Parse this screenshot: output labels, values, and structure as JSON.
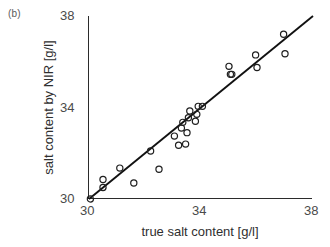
{
  "panel": {
    "label": "(b)"
  },
  "chart_data": {
    "type": "scatter",
    "title": "",
    "subtitle": "",
    "xlabel": "true salt content [g/l]",
    "ylabel": "salt content by NIR [g/l]",
    "xlim": [
      30,
      38
    ],
    "ylim": [
      30,
      38
    ],
    "xticks": [
      30,
      34,
      38
    ],
    "yticks": [
      30,
      34,
      38
    ],
    "xticklabels": [
      "30",
      "34",
      "38"
    ],
    "yticklabels": [
      "30",
      "34",
      "38"
    ],
    "grid": false,
    "legend": null,
    "marker": "open-circle",
    "marker_color": "#1f1f1f",
    "line_color": "#111111",
    "reference_line": {
      "name": "identity-line",
      "description": "1:1 diagonal line from lower-left to upper-right corner",
      "x": [
        30,
        38
      ],
      "y": [
        30,
        38
      ]
    },
    "points": [
      {
        "x": 30.05,
        "y": 30.0
      },
      {
        "x": 30.5,
        "y": 30.85
      },
      {
        "x": 30.5,
        "y": 30.5
      },
      {
        "x": 31.1,
        "y": 31.35
      },
      {
        "x": 31.6,
        "y": 30.7
      },
      {
        "x": 32.2,
        "y": 32.1
      },
      {
        "x": 32.5,
        "y": 31.3
      },
      {
        "x": 33.05,
        "y": 32.75
      },
      {
        "x": 33.2,
        "y": 32.35
      },
      {
        "x": 33.3,
        "y": 33.1
      },
      {
        "x": 33.35,
        "y": 33.35
      },
      {
        "x": 33.45,
        "y": 32.4
      },
      {
        "x": 33.5,
        "y": 32.9
      },
      {
        "x": 33.55,
        "y": 33.55
      },
      {
        "x": 33.6,
        "y": 33.85
      },
      {
        "x": 33.8,
        "y": 33.4
      },
      {
        "x": 33.85,
        "y": 33.7
      },
      {
        "x": 33.9,
        "y": 34.05
      },
      {
        "x": 34.05,
        "y": 34.05
      },
      {
        "x": 35.0,
        "y": 35.8
      },
      {
        "x": 35.05,
        "y": 35.45
      },
      {
        "x": 35.1,
        "y": 35.45
      },
      {
        "x": 35.95,
        "y": 36.3
      },
      {
        "x": 36.0,
        "y": 35.75
      },
      {
        "x": 36.95,
        "y": 37.2
      },
      {
        "x": 37.0,
        "y": 36.35
      }
    ]
  }
}
